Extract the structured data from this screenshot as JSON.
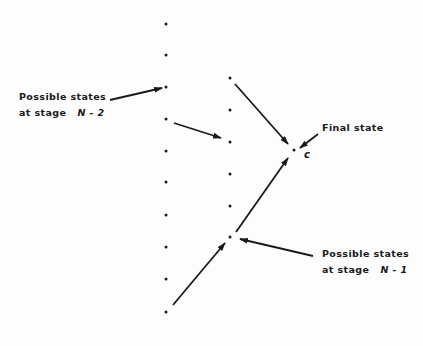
{
  "diagram": {
    "type": "dynamic-programming-stages",
    "labels": {
      "stage_n2": {
        "line1": "Possible states",
        "line2_prefix": "at stage",
        "line2_var": "N - 2"
      },
      "stage_n1": {
        "line1": "Possible states",
        "line2_prefix": "at stage",
        "line2_var": "N - 1"
      },
      "final": "Final state",
      "final_var": "c"
    },
    "columns": {
      "stage_n2": {
        "x": 166,
        "ys": [
          24,
          55,
          87,
          119,
          151,
          182,
          215,
          247,
          279,
          312
        ]
      },
      "stage_n1": {
        "x": 230,
        "ys": [
          78,
          110,
          142,
          174,
          206,
          237
        ]
      },
      "final": {
        "x": 294,
        "y": 150
      }
    },
    "arrows": [
      {
        "from": [
          110,
          100
        ],
        "to": [
          162,
          88
        ],
        "desc": "label N-2 to state"
      },
      {
        "from": [
          174,
          123
        ],
        "to": [
          221,
          138
        ],
        "desc": "N-2 state to N-1 state"
      },
      {
        "from": [
          235,
          84
        ],
        "to": [
          288,
          144
        ],
        "desc": "N-1 state to final"
      },
      {
        "from": [
          236,
          232
        ],
        "to": [
          288,
          158
        ],
        "desc": "N-1 state to final"
      },
      {
        "from": [
          173,
          305
        ],
        "to": [
          225,
          243
        ],
        "desc": "N-2 state to N-1 state"
      },
      {
        "from": [
          318,
          134
        ],
        "to": [
          300,
          148
        ],
        "desc": "label Final state"
      },
      {
        "from": [
          313,
          256
        ],
        "to": [
          240,
          239
        ],
        "desc": "label N-1 to state"
      }
    ],
    "colors": {
      "ink": "#1a1a1a",
      "background": "#fdfdfd"
    }
  }
}
